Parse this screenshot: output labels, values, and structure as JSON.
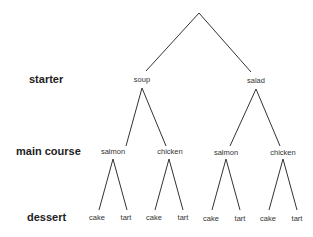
{
  "levels": {
    "starter": "starter",
    "main_course": "main course",
    "dessert": "dessert"
  },
  "tree": {
    "starter": [
      "soup",
      "salad"
    ],
    "main_course": [
      "salmon",
      "chicken",
      "salmon",
      "chicken"
    ],
    "dessert": [
      "cake",
      "tart",
      "cake",
      "tart",
      "cake",
      "tart",
      "cake",
      "tart"
    ]
  },
  "colors": {
    "line": "#333333",
    "text": "#222222"
  }
}
